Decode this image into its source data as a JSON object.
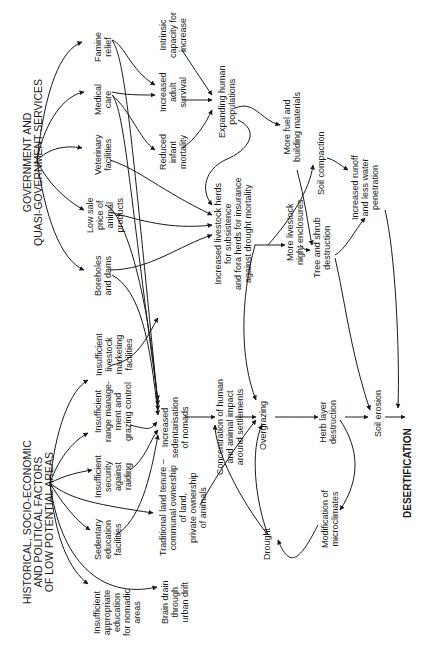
{
  "diagram": {
    "orientation": "rotated-90-ccw",
    "groups": {
      "government": "GOVERNMENT AND\nQUASI-GOVERNMENT SERVICES",
      "historical": "HISTORICAL, SOCIO-ECONOMIC\nAND POLITICAL FACTORS\nOF LOW POTENTIAL AREAS"
    },
    "nodes": {
      "famine_relief": "Famine\nrelief",
      "medical_care": "Medical\ncare",
      "veterinary": "Veterinary\nfacilities",
      "low_sale_price": "Low sale\nprice of\nanimal\nproducts",
      "boreholes": "Boreholes\nand dams",
      "insufficient_marketing": "Insufficient\nlivestock\nmarketing\nfacilities",
      "insufficient_range": "Insufficient\nrange manage-\nment and\ngrazing control",
      "insufficient_security": "Insufficient\nsecurity\nagainst\nraiding",
      "sedentary_education": "Sedentary\neducation\nfacilities",
      "insufficient_education": "Insufficient\nappropriate\neducation\nfor nomadic\nareas",
      "intrinsic_capacity": "Intrinsic\ncapacity for\nincrease",
      "increased_adult_survival": "Increased\nadult\nsurvival",
      "reduced_infant_mortality": "Reduced\ninfant\nmortality",
      "expanding_populations": "Expanding human\npopulations",
      "increased_sedentarisation": "Increased\nsedentarisation\nof nomads",
      "traditional_land_tenure": "Traditional land tenure –\ncommunal ownership\nof land,\nprivate ownership\nof animals",
      "brain_drain": "Brain drain\nthrough\nurban drift",
      "increased_herds": "Increased livestock herds\nfor subsistence\nand fora herds for insurance\nagainst drought mortality",
      "concentration": "Concentration of human\nand animal impact\naround settlements",
      "drought": "Drought",
      "more_fuel": "More fuel and\nbuilding materials",
      "more_enclosures": "More livestock\nnight enclosures",
      "overgrazing": "Overgrazing",
      "soil_compaction": "Soil compaction",
      "tree_destruction": "Tree and shrub\ndestruction",
      "increased_runoff": "Increased runoff\nand less water\npenetration",
      "herb_layer": "Herb layer\ndestruction",
      "modification_microclimates": "Modification of\nmicroclimates",
      "soil_erosion": "Soil erosion",
      "desertification": "DESERTIFICATION"
    }
  }
}
